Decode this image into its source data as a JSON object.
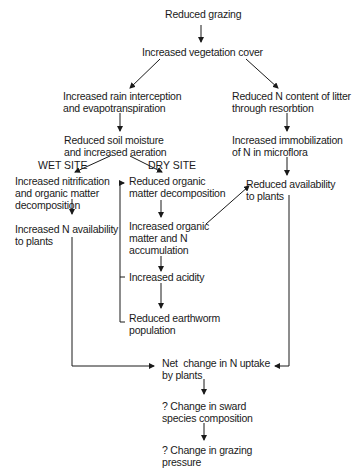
{
  "diagram": {
    "type": "flowchart",
    "nodes": {
      "reduced_grazing": "Reduced grazing",
      "increased_vegetation_cover": "Increased vegetation cover",
      "rain_interception": "Increased rain interception\nand evapotranspiration",
      "reduced_n_litter": "Reduced N content of litter\nthrough resorbtion",
      "reduced_soil_moisture": "Reduced soil moisture\nand increased aeration",
      "immobilization": "Increased immobilization\nof N in microflora",
      "nitrification": "Increased nitrification\nand organic matter\ndecomposition",
      "reduced_om_decomposition": "Reduced organic\nmatter decomposition",
      "reduced_availability": "Reduced availability\nto plants",
      "increased_n_availability": "Increased N availability\nto plants",
      "om_n_accumulation": "Increased organic\nmatter and N\naccumulation",
      "increased_acidity": "Increased acidity",
      "reduced_earthworm": "Reduced earthworm\npopulation",
      "net_change_uptake": "Net  change in N uptake\nby plants",
      "sward_composition": "? Change in sward\nspecies composition",
      "grazing_pressure": "? Change in grazing\npressure"
    },
    "branch_labels": {
      "wet_site": "WET SITE",
      "dry_site": "DRY SITE"
    },
    "edges": [
      [
        "reduced_grazing",
        "increased_vegetation_cover"
      ],
      [
        "increased_vegetation_cover",
        "rain_interception"
      ],
      [
        "increased_vegetation_cover",
        "reduced_n_litter"
      ],
      [
        "rain_interception",
        "reduced_soil_moisture"
      ],
      [
        "reduced_n_litter",
        "immobilization"
      ],
      [
        "immobilization",
        "reduced_availability"
      ],
      [
        "reduced_soil_moisture",
        "nitrification"
      ],
      [
        "reduced_soil_moisture",
        "reduced_om_decomposition"
      ],
      [
        "nitrification",
        "increased_n_availability"
      ],
      [
        "reduced_om_decomposition",
        "om_n_accumulation"
      ],
      [
        "om_n_accumulation",
        "reduced_availability"
      ],
      [
        "om_n_accumulation",
        "increased_acidity"
      ],
      [
        "increased_acidity",
        "reduced_earthworm"
      ],
      [
        "reduced_earthworm",
        "reduced_om_decomposition"
      ],
      [
        "increased_n_availability",
        "net_change_uptake"
      ],
      [
        "reduced_availability",
        "net_change_uptake"
      ],
      [
        "net_change_uptake",
        "sward_composition"
      ],
      [
        "sward_composition",
        "grazing_pressure"
      ]
    ]
  }
}
